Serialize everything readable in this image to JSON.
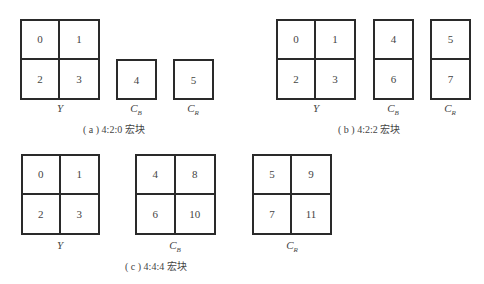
{
  "panels": [
    {
      "id": "a",
      "caption": "( a ) 4:2:0 宏块",
      "blocks": [
        {
          "label": "Y",
          "sub": "",
          "cells": [
            "0",
            "1",
            "2",
            "3"
          ],
          "cols": 2,
          "rows": 2
        },
        {
          "label": "C",
          "sub": "B",
          "cells": [
            "4"
          ],
          "cols": 1,
          "rows": 1
        },
        {
          "label": "C",
          "sub": "R",
          "cells": [
            "5"
          ],
          "cols": 1,
          "rows": 1
        }
      ]
    },
    {
      "id": "b",
      "caption": "( b ) 4:2:2 宏块",
      "blocks": [
        {
          "label": "Y",
          "sub": "",
          "cells": [
            "0",
            "1",
            "2",
            "3"
          ],
          "cols": 2,
          "rows": 2
        },
        {
          "label": "C",
          "sub": "B",
          "cells": [
            "4",
            "6"
          ],
          "cols": 1,
          "rows": 2
        },
        {
          "label": "C",
          "sub": "R",
          "cells": [
            "5",
            "7"
          ],
          "cols": 1,
          "rows": 2
        }
      ]
    },
    {
      "id": "c",
      "caption": "( c ) 4:4:4 宏块",
      "blocks": [
        {
          "label": "Y",
          "sub": "",
          "cells": [
            "0",
            "1",
            "2",
            "3"
          ],
          "cols": 2,
          "rows": 2
        },
        {
          "label": "C",
          "sub": "B",
          "cells": [
            "4",
            "8",
            "6",
            "10"
          ],
          "cols": 2,
          "rows": 2
        },
        {
          "label": "C",
          "sub": "R",
          "cells": [
            "5",
            "9",
            "7",
            "11"
          ],
          "cols": 2,
          "rows": 2
        }
      ]
    }
  ]
}
